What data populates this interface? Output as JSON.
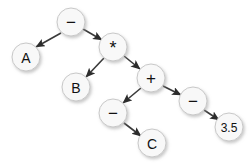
{
  "diagram": {
    "type": "binary-expression-tree",
    "canvas": {
      "width": 249,
      "height": 167,
      "background": "#ffffff"
    },
    "style": {
      "node_fill": "#f8f8f8",
      "node_stroke": "#c8c8c8",
      "edge_color": "#3a3a3a",
      "label_color": "#111111",
      "shadow_color": "#d0d0d0"
    },
    "nodes": [
      {
        "id": "n1",
        "label": "−",
        "cx": 71,
        "cy": 22,
        "r": 14,
        "font_size": 17,
        "role": "root-operator"
      },
      {
        "id": "n2",
        "label": "A",
        "cx": 26,
        "cy": 57,
        "r": 14,
        "font_size": 14,
        "role": "operand"
      },
      {
        "id": "n3",
        "label": "*",
        "cx": 113,
        "cy": 47,
        "r": 14,
        "font_size": 18,
        "role": "operator"
      },
      {
        "id": "n4",
        "label": "B",
        "cx": 76,
        "cy": 87,
        "r": 14,
        "font_size": 14,
        "role": "operand"
      },
      {
        "id": "n5",
        "label": "+",
        "cx": 151,
        "cy": 78,
        "r": 14,
        "font_size": 17,
        "role": "operator"
      },
      {
        "id": "n6",
        "label": "−",
        "cx": 113,
        "cy": 113,
        "r": 14,
        "font_size": 17,
        "role": "operator"
      },
      {
        "id": "n7",
        "label": "−",
        "cx": 193,
        "cy": 101,
        "r": 14,
        "font_size": 17,
        "role": "operator"
      },
      {
        "id": "n8",
        "label": "C",
        "cx": 152,
        "cy": 143,
        "r": 14,
        "font_size": 14,
        "role": "operand"
      },
      {
        "id": "n9",
        "label": "3.5",
        "cx": 229,
        "cy": 127,
        "r": 14,
        "font_size": 12,
        "role": "operand"
      }
    ],
    "edges": [
      {
        "from": "n1",
        "to": "n2",
        "x1": 61,
        "y1": 33,
        "x2": 36,
        "y2": 47
      },
      {
        "from": "n1",
        "to": "n3",
        "x1": 83,
        "y1": 29,
        "x2": 102,
        "y2": 40
      },
      {
        "from": "n3",
        "to": "n4",
        "x1": 104,
        "y1": 58,
        "x2": 86,
        "y2": 77
      },
      {
        "from": "n3",
        "to": "n5",
        "x1": 124,
        "y1": 56,
        "x2": 140,
        "y2": 69
      },
      {
        "from": "n5",
        "to": "n6",
        "x1": 141,
        "y1": 88,
        "x2": 123,
        "y2": 103
      },
      {
        "from": "n5",
        "to": "n7",
        "x1": 163,
        "y1": 86,
        "x2": 181,
        "y2": 95
      },
      {
        "from": "n6",
        "to": "n8",
        "x1": 124,
        "y1": 123,
        "x2": 141,
        "y2": 136
      },
      {
        "from": "n7",
        "to": "n9",
        "x1": 204,
        "y1": 110,
        "x2": 219,
        "y2": 120
      }
    ]
  }
}
